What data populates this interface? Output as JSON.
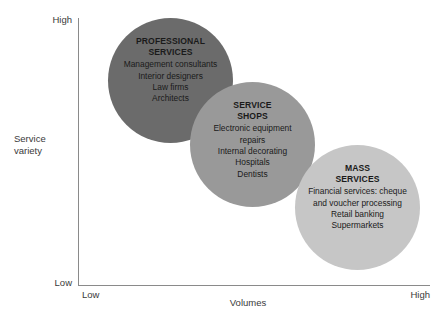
{
  "chart_data": {
    "type": "scatter",
    "title": "",
    "xlabel": "Volumes",
    "ylabel": "Service variety",
    "x_ticks": [
      "Low",
      "High"
    ],
    "y_ticks": [
      "Low",
      "High"
    ],
    "grid": false,
    "legend": "none",
    "note": "Three overlapping bubbles arranged along a descending diagonal: high service variety / low volume to low service variety / high volume.",
    "bubbles": [
      {
        "name": "professional-services",
        "heading": "PROFESSIONAL\nSERVICES",
        "items": [
          "Management consultants",
          "Interior designers",
          "Law firms",
          "Architects"
        ],
        "color": "#6b6b6b",
        "x": 0.15,
        "y": 0.88,
        "size": 125
      },
      {
        "name": "service-shops",
        "heading": "SERVICE\nSHOPS",
        "items": [
          "Electronic equipment\nrepairs",
          "Internal decorating",
          "Hospitals",
          "Dentists"
        ],
        "color": "#999999",
        "x": 0.47,
        "y": 0.6,
        "size": 125
      },
      {
        "name": "mass-services",
        "heading": "MASS\nSERVICES",
        "items": [
          "Financial services: cheque\nand voucher processing",
          "Retail banking",
          "Supermarkets"
        ],
        "color": "#c6c6c6",
        "x": 0.79,
        "y": 0.32,
        "size": 125
      }
    ]
  },
  "axes": {
    "y_high_label": "High",
    "y_low_label": "Low",
    "y_title": "Service\nvariety",
    "x_low_label": "Low",
    "x_high_label": "High",
    "x_title": "Volumes",
    "line_color": "#8a8a8a"
  },
  "bubbles": [
    {
      "heading": "PROFESSIONAL\nSERVICES",
      "item0": "Management consultants",
      "item1": "Interior designers",
      "item2": "Law firms",
      "item3": "Architects",
      "color": "#6b6b6b"
    },
    {
      "heading": "SERVICE\nSHOPS",
      "item0": "Electronic equipment\nrepairs",
      "item1": "Internal decorating",
      "item2": "Hospitals",
      "item3": "Dentists",
      "color": "#999999"
    },
    {
      "heading": "MASS\nSERVICES",
      "item0": "Financial services: cheque\nand voucher processing",
      "item1": "Retail banking",
      "item2": "Supermarkets",
      "color": "#c6c6c6"
    }
  ]
}
